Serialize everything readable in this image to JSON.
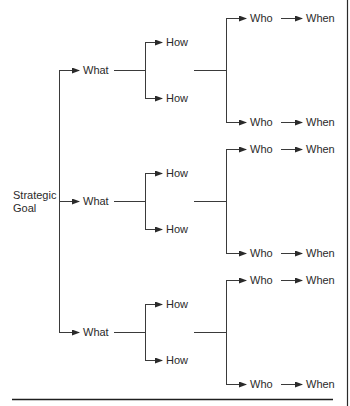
{
  "diagram": {
    "root": {
      "label_line1": "Strategic",
      "label_line2": "Goal"
    },
    "branches": [
      {
        "what": "What",
        "hows": [
          "How",
          "How"
        ],
        "who_when": [
          {
            "who": "Who",
            "when": "When"
          },
          {
            "who": "Who",
            "when": "When"
          }
        ]
      },
      {
        "what": "What",
        "hows": [
          "How",
          "How"
        ],
        "who_when": [
          {
            "who": "Who",
            "when": "When"
          },
          {
            "who": "Who",
            "when": "When"
          }
        ]
      },
      {
        "what": "What",
        "hows": [
          "How",
          "How"
        ],
        "who_when": [
          {
            "who": "Who",
            "when": "When"
          },
          {
            "who": "Who",
            "when": "When"
          }
        ]
      }
    ],
    "colors": {
      "line": "#3a3a3a",
      "text": "#2a2a2a",
      "background": "#ffffff"
    }
  }
}
